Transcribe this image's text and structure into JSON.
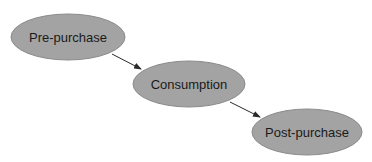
{
  "diagram": {
    "type": "flow",
    "colors": {
      "node_fill": "#a3a3a3",
      "node_stroke": "#8a8a8a",
      "arrow": "#2a2a2a",
      "text": "#1a1a1a",
      "background": "#ffffff"
    },
    "nodes": [
      {
        "id": "pre-purchase",
        "label": "Pre-purchase",
        "cx": 68,
        "cy": 37,
        "rx": 57,
        "ry": 23
      },
      {
        "id": "consumption",
        "label": "Consumption",
        "cx": 189,
        "cy": 84,
        "rx": 56,
        "ry": 23
      },
      {
        "id": "post-purchase",
        "label": "Post-purchase",
        "cx": 307,
        "cy": 132,
        "rx": 55,
        "ry": 23
      }
    ],
    "edges": [
      {
        "from": "pre-purchase",
        "to": "consumption"
      },
      {
        "from": "consumption",
        "to": "post-purchase"
      }
    ]
  }
}
